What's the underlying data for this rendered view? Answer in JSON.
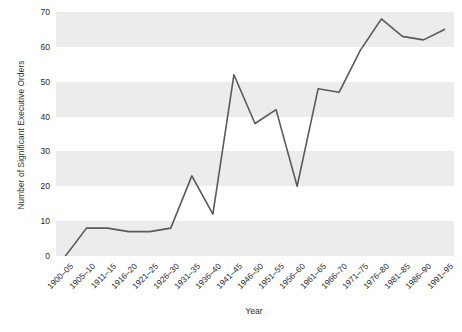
{
  "chart_data": {
    "type": "line",
    "title": "",
    "xlabel": "Year",
    "ylabel": "Number of Significant Executive Orders",
    "categories": [
      "1900–05",
      "1905–10",
      "1911–15",
      "1916–20",
      "1921–25",
      "1926–30",
      "1931–35",
      "1936–40",
      "1941–45",
      "1946–50",
      "1951–55",
      "1956–60",
      "1961–65",
      "1966–70",
      "1971–75",
      "1976–80",
      "1981–85",
      "1986–90",
      "1991–95"
    ],
    "values": [
      0,
      8,
      8,
      7,
      7,
      8,
      23,
      12,
      52,
      38,
      42,
      20,
      48,
      47,
      59,
      68,
      63,
      62,
      65
    ],
    "ylim": [
      0,
      70
    ],
    "yticks": [
      0,
      10,
      20,
      30,
      40,
      50,
      60,
      70
    ],
    "ytick_labels": [
      "0",
      "10",
      "20",
      "30",
      "40",
      "50",
      "60",
      "70"
    ],
    "grid": "horizontal-alternating-bands",
    "legend": "none",
    "line_color": "#5a5a5a",
    "band_color": "#ececec",
    "background_color": "#ffffff"
  }
}
